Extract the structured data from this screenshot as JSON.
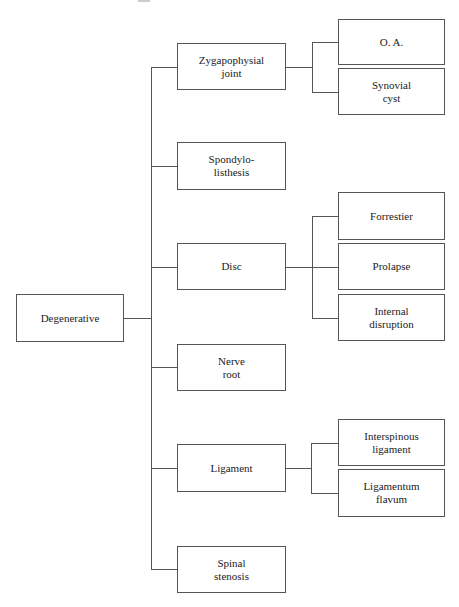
{
  "diagram": {
    "type": "tree",
    "root": {
      "label": "Degenerative",
      "children": [
        {
          "label": "Zygapophysial\njoint",
          "children": [
            {
              "label": "O. A."
            },
            {
              "label": "Synovial\ncyst"
            }
          ]
        },
        {
          "label": "Spondylo-\nlisthesis",
          "children": []
        },
        {
          "label": "Disc",
          "children": [
            {
              "label": "Forrestier"
            },
            {
              "label": "Prolapse"
            },
            {
              "label": "Internal\ndisruption"
            }
          ]
        },
        {
          "label": "Nerve\nroot",
          "children": []
        },
        {
          "label": "Ligament",
          "children": [
            {
              "label": "Interspinous\nligament"
            },
            {
              "label": "Ligamentum\nflavum"
            }
          ]
        },
        {
          "label": "Spinal\nstenosis",
          "children": []
        }
      ]
    }
  }
}
